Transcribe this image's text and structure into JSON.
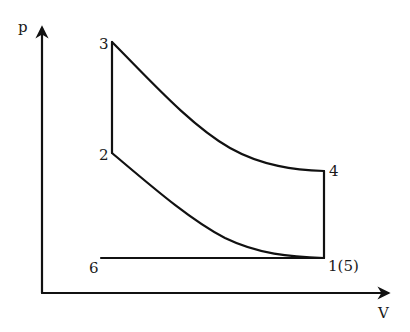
{
  "diagram": {
    "type": "p-V diagram",
    "axes": {
      "y_label": "p",
      "x_label": "V"
    },
    "points": [
      {
        "id": "1",
        "label": "1(5)"
      },
      {
        "id": "2",
        "label": "2"
      },
      {
        "id": "3",
        "label": "3"
      },
      {
        "id": "4",
        "label": "4"
      },
      {
        "id": "6",
        "label": "6"
      }
    ],
    "processes": [
      {
        "from": "1",
        "to": "2",
        "shape": "curve"
      },
      {
        "from": "2",
        "to": "3",
        "shape": "vertical line"
      },
      {
        "from": "3",
        "to": "4",
        "shape": "curve"
      },
      {
        "from": "4",
        "to": "1",
        "shape": "vertical line"
      },
      {
        "from": "6",
        "to": "1",
        "shape": "horizontal line"
      }
    ],
    "colors": {
      "line": "#111111",
      "background": "#ffffff"
    }
  }
}
